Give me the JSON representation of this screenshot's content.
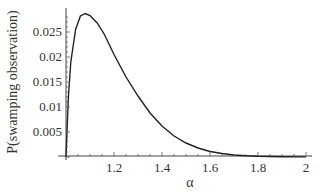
{
  "chart_data": {
    "type": "line",
    "title": "",
    "xlabel": "α",
    "ylabel": "P(swamping observation)",
    "xlim": [
      1.0,
      2.0
    ],
    "ylim": [
      0,
      0.029
    ],
    "grid": false,
    "legend": null,
    "x_ticks": [
      "1.2",
      "1.4",
      "1.6",
      "1.8",
      "2"
    ],
    "y_ticks": [
      "0.005",
      "0.01",
      "0.015",
      "0.02",
      "0.025"
    ],
    "series": [
      {
        "name": "P(swamping observation)",
        "x": [
          1.0,
          1.01,
          1.02,
          1.04,
          1.06,
          1.08,
          1.1,
          1.13,
          1.16,
          1.2,
          1.25,
          1.3,
          1.35,
          1.4,
          1.45,
          1.5,
          1.55,
          1.6,
          1.65,
          1.7,
          1.75,
          1.8,
          1.9,
          2.0
        ],
        "y": [
          0.0,
          0.012,
          0.019,
          0.0255,
          0.0282,
          0.0287,
          0.0283,
          0.0268,
          0.0245,
          0.0205,
          0.016,
          0.0122,
          0.0088,
          0.0062,
          0.0042,
          0.0028,
          0.0018,
          0.0011,
          0.0007,
          0.0004,
          0.00025,
          0.00015,
          6e-05,
          2e-05
        ]
      }
    ]
  }
}
